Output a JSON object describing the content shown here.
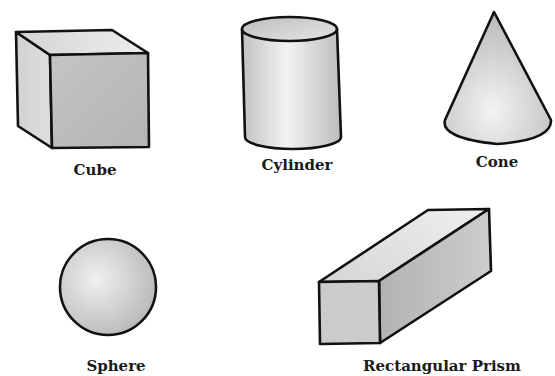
{
  "diagram": {
    "shapes": [
      {
        "id": "cube",
        "label": "Cube"
      },
      {
        "id": "cylinder",
        "label": "Cylinder"
      },
      {
        "id": "cone",
        "label": "Cone"
      },
      {
        "id": "sphere",
        "label": "Sphere"
      },
      {
        "id": "rectangular-prism",
        "label": "Rectangular Prism"
      }
    ]
  },
  "colors": {
    "background": "#ffffff",
    "outline": "#111111",
    "fill_light": "#ececec",
    "fill_mid": "#cfcfcf",
    "fill_dark": "#b8b8b8"
  }
}
